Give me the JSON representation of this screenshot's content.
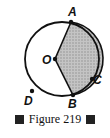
{
  "figure": {
    "caption": "Figure 219",
    "points": {
      "A": "A",
      "B": "B",
      "C": "C",
      "D": "D",
      "O": "O"
    },
    "shaded_region": "sector OACB",
    "colors": {
      "stroke": "#111111",
      "shade": "#b8b8b8"
    }
  }
}
